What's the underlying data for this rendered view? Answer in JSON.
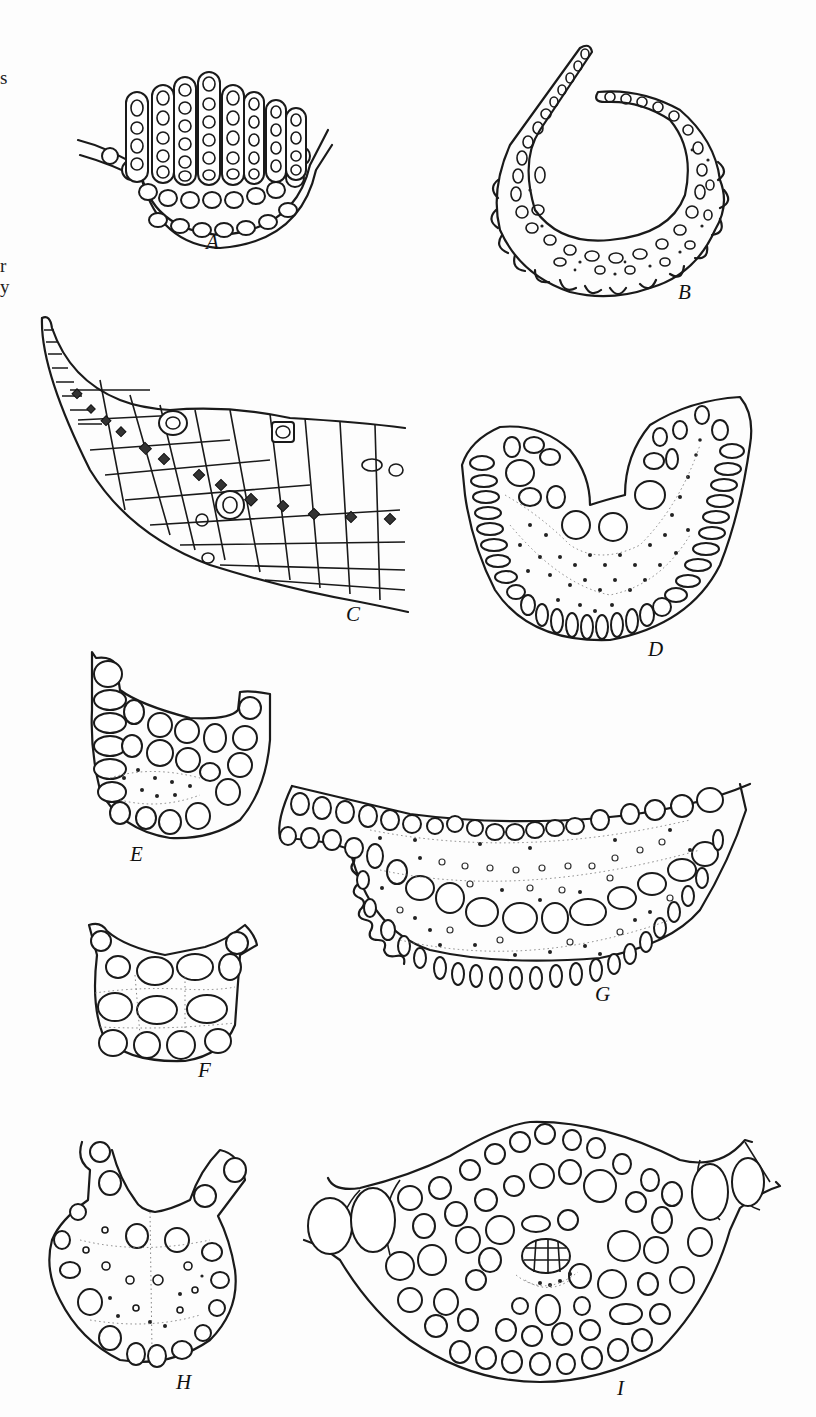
{
  "figure": {
    "type": "botanical line-drawing plate",
    "edge_text_fragments": [
      {
        "text": "s",
        "y": 68
      },
      {
        "text": "r",
        "y": 256
      },
      {
        "text": "y",
        "y": 277
      }
    ],
    "panels": [
      {
        "id": "A",
        "label": "A",
        "description": "leaf section bearing 8 uniseriate photosynthetic lamellae (filaments of rounded cells) on upper surface"
      },
      {
        "id": "B",
        "label": "B",
        "description": "strongly curved / inrolled leaf section with papillose (lobed) outer margin and scattered stereid dots"
      },
      {
        "id": "C",
        "label": "C",
        "description": "tapering leaf section of polygonal cells with a row of darkened small cells and scattered thick-walled cells"
      },
      {
        "id": "D",
        "label": "D",
        "description": "U-shaped costa section with elongate outer cells, two large guide cells and stippled stereid band"
      },
      {
        "id": "E",
        "label": "E",
        "description": "small U-shaped costa section of rounded cells with central dotted stereid group"
      },
      {
        "id": "F",
        "label": "F",
        "description": "small costa section of rounded cells with dashed cell outlines"
      },
      {
        "id": "G",
        "label": "G",
        "description": "wide crescent-shaped costa section with wavy margins, row of large guide cells and many scattered stereids"
      },
      {
        "id": "H",
        "label": "H",
        "description": "rounded costa section with two upward lamina arms and scattered small cells"
      },
      {
        "id": "I",
        "label": "I",
        "description": "lens-shaped costa section of many rounded cells with central strand of small polygonal cells"
      }
    ]
  }
}
